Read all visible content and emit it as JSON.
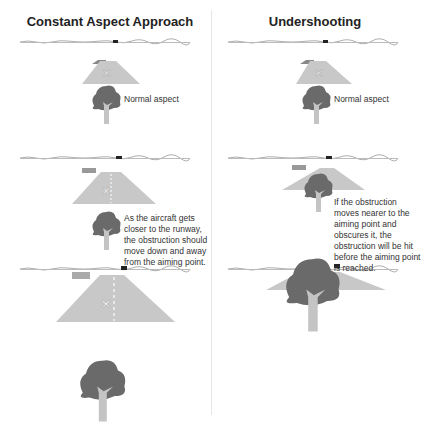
{
  "panels": [
    {
      "title": "Constant Aspect Approach",
      "captions": [
        "Normal aspect",
        "As the aircraft gets closer to the runway, the obstruction should move down and away from the aiming point."
      ]
    },
    {
      "title": "Undershooting",
      "captions": [
        "Normal aspect",
        "If the obstruction moves nearer to the aiming point and obscures it, the obstruction will be hit before the aiming point is reached."
      ]
    }
  ],
  "colors": {
    "runway": "#c8c8c8",
    "tree_canopy": "#6a6a6a",
    "tree_trunk": "#c4c4c4",
    "horizon": "#999999",
    "building": "#555555"
  }
}
